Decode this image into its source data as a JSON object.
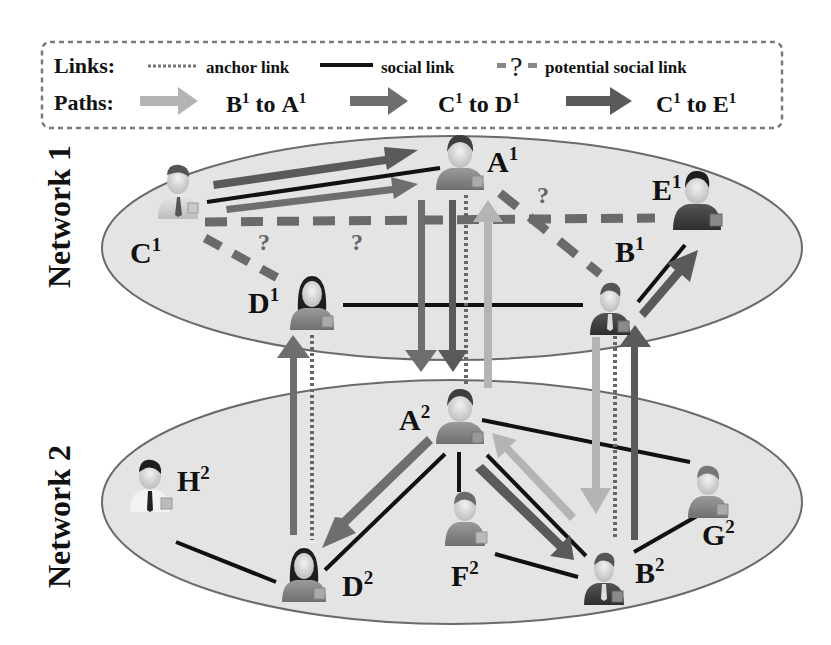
{
  "legend": {
    "links_label": "Links:",
    "anchor_link_label": "anchor link",
    "social_link_label": "social link",
    "potential_mark": "?",
    "potential_social_link_label": "potential social link",
    "paths_label": "Paths:",
    "paths": [
      {
        "from": "B",
        "from_sup": "1",
        "to": "A",
        "to_sup": "1",
        "connector": "to",
        "color": "#b4b4b4"
      },
      {
        "from": "C",
        "from_sup": "1",
        "to": "D",
        "to_sup": "1",
        "connector": "to",
        "color": "#6e6e6e"
      },
      {
        "from": "C",
        "from_sup": "1",
        "to": "E",
        "to_sup": "1",
        "connector": "to",
        "color": "#5a5a5a"
      }
    ]
  },
  "networks": [
    {
      "label": "Network 1"
    },
    {
      "label": "Network 2"
    }
  ],
  "nodes": {
    "A1": {
      "letter": "A",
      "sup": "1"
    },
    "B1": {
      "letter": "B",
      "sup": "1"
    },
    "C1": {
      "letter": "C",
      "sup": "1"
    },
    "D1": {
      "letter": "D",
      "sup": "1"
    },
    "E1": {
      "letter": "E",
      "sup": "1"
    },
    "A2": {
      "letter": "A",
      "sup": "2"
    },
    "B2": {
      "letter": "B",
      "sup": "2"
    },
    "D2": {
      "letter": "D",
      "sup": "2"
    },
    "F2": {
      "letter": "F",
      "sup": "2"
    },
    "G2": {
      "letter": "G",
      "sup": "2"
    },
    "H2": {
      "letter": "H",
      "sup": "2"
    }
  },
  "potential_marks": [
    "?",
    "?",
    "?"
  ],
  "edges": {
    "social_network1": [
      [
        "C1",
        "A1"
      ],
      [
        "D1",
        "B1"
      ],
      [
        "B1",
        "E1"
      ]
    ],
    "potential_network1": [
      [
        "C1",
        "E1"
      ],
      [
        "C1",
        "D1"
      ],
      [
        "A1",
        "B1"
      ]
    ],
    "social_network2": [
      [
        "A2",
        "D2"
      ],
      [
        "A2",
        "F2"
      ],
      [
        "A2",
        "B2"
      ],
      [
        "A2",
        "G2"
      ],
      [
        "H2",
        "D2"
      ],
      [
        "F2",
        "B2"
      ],
      [
        "B2",
        "G2"
      ]
    ],
    "anchor": [
      [
        "A1",
        "A2"
      ],
      [
        "B1",
        "B2"
      ],
      [
        "D1",
        "D2"
      ]
    ]
  },
  "colors": {
    "ellipse_fill": "#e4e4e4",
    "ellipse_stroke": "#6a6a6a",
    "light_path": "#b4b4b4",
    "medium_path": "#6e6e6e",
    "dark_path": "#5a5a5a",
    "social_link": "#111111",
    "potential_link": "#6a6a6a",
    "anchor_link": "#666666"
  }
}
